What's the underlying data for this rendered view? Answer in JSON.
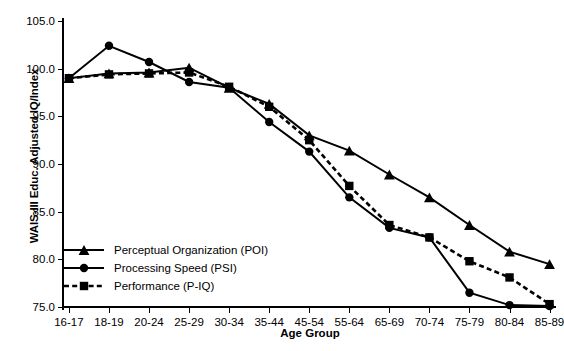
{
  "chart_data": {
    "type": "line",
    "title": "",
    "xlabel": "Age Group",
    "ylabel": "WAIS-III Educ. Adjusted IQ/Index",
    "categories": [
      "16-17",
      "18-19",
      "20-24",
      "25-29",
      "30-34",
      "35-44",
      "45-54",
      "55-64",
      "65-69",
      "70-74",
      "75-79",
      "80-84",
      "85-89"
    ],
    "ylim": [
      75.0,
      105.0
    ],
    "yticks": [
      "75.0",
      "80.0",
      "85.0",
      "90.0",
      "95.0",
      "100.0",
      "105.0"
    ],
    "ytick_values": [
      75.0,
      80.0,
      85.0,
      90.0,
      95.0,
      100.0,
      105.0
    ],
    "grid": false,
    "legend_position": "bottom-left",
    "series": [
      {
        "name": "Perceptual Organization (POI)",
        "marker": "triangle",
        "linestyle": "solid",
        "color": "#000000",
        "values": [
          99.0,
          99.5,
          99.6,
          100.1,
          98.0,
          96.3,
          93.0,
          91.4,
          88.9,
          86.5,
          83.6,
          80.8,
          79.5
        ]
      },
      {
        "name": "Processing Speed (PSI)",
        "marker": "circle",
        "linestyle": "solid",
        "color": "#000000",
        "values": [
          99.0,
          102.4,
          100.7,
          98.6,
          98.0,
          94.4,
          91.3,
          86.5,
          83.3,
          82.3,
          76.5,
          75.2,
          75.1
        ]
      },
      {
        "name": "Performance (P-IQ)",
        "marker": "square",
        "linestyle": "dashed",
        "color": "#000000",
        "values": [
          99.0,
          99.4,
          99.5,
          99.6,
          98.1,
          96.0,
          92.5,
          87.7,
          83.6,
          82.3,
          79.8,
          78.1,
          75.3
        ]
      }
    ]
  }
}
